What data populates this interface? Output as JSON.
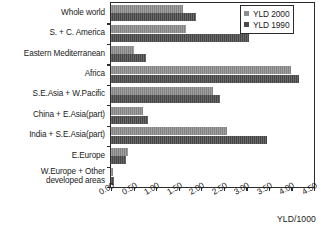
{
  "chart_data": {
    "type": "bar",
    "orientation": "horizontal",
    "title": "",
    "xlabel": "YLD/1000",
    "ylabel": "",
    "xlim": [
      0.0,
      4.5
    ],
    "grid": false,
    "legend_position": "top-right",
    "xticks": [
      "0.00",
      "0.50",
      "1.00",
      "1.50",
      "2.00",
      "2.50",
      "3.00",
      "3.50",
      "4.00",
      "4.50"
    ],
    "categories": [
      "Whole world",
      "S. + C. America",
      "Eastern Mediterranean",
      "Africa",
      "S.E.Asia + W.Pacific",
      "China + E.Asia(part)",
      "India + S.E.Asia(part)",
      "E.Europe",
      "W.Europe + Other\ndeveloped areas"
    ],
    "series": [
      {
        "name": "YLD 2000",
        "color": "#8d8d8d",
        "values": [
          1.6,
          1.66,
          0.51,
          4.0,
          2.26,
          0.72,
          2.57,
          0.37,
          0.04
        ]
      },
      {
        "name": "YLD 1990",
        "color": "#4b4b4b",
        "values": [
          1.88,
          3.06,
          0.78,
          4.17,
          2.42,
          0.81,
          3.45,
          0.33,
          0.06
        ]
      }
    ]
  }
}
